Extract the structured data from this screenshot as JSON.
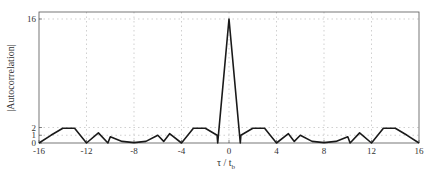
{
  "chart_data": {
    "type": "line",
    "title": "",
    "xlabel": "τ / t",
    "xlabel_sub": "b",
    "ylabel": "|Autocorrelation|",
    "xlim": [
      -16,
      16
    ],
    "ylim": [
      0,
      16
    ],
    "xticks": [
      -16,
      -12,
      -8,
      -4,
      0,
      4,
      8,
      12,
      16
    ],
    "xtick_labels": [
      "-16",
      "-12",
      "-8",
      "-4",
      "0",
      "4",
      "8",
      "12",
      "16"
    ],
    "yticks": [
      0,
      1,
      2,
      16
    ],
    "ytick_labels": [
      "0",
      "1",
      "2",
      "16"
    ],
    "grid": true,
    "legend": "none",
    "series": [
      {
        "name": "autocorrelation",
        "color": "#1a1a1a",
        "x": [
          -16,
          -15,
          -14,
          -13,
          -12,
          -11,
          -10.2,
          -10,
          -9,
          -8,
          -7,
          -6,
          -5.5,
          -5,
          -4,
          -3,
          -2,
          -1,
          -0.95,
          0,
          0.95,
          1,
          2,
          3,
          4,
          5,
          5.5,
          6,
          7,
          8,
          9,
          10,
          10.2,
          11,
          12,
          13,
          14,
          15,
          16
        ],
        "y": [
          0,
          1,
          1.9,
          1.9,
          0,
          1.3,
          0,
          0.8,
          0.2,
          0.05,
          0.2,
          1.0,
          0.2,
          1.2,
          0,
          1.9,
          1.9,
          1.0,
          0,
          16,
          0,
          1.0,
          1.9,
          1.9,
          0,
          1.2,
          0.2,
          1.0,
          0.2,
          0.05,
          0.2,
          0.8,
          0,
          1.3,
          0,
          1.9,
          1.9,
          1,
          0
        ]
      }
    ]
  }
}
